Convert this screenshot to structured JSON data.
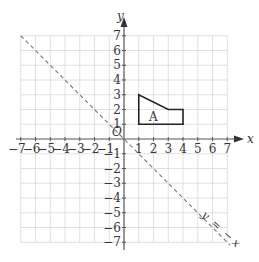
{
  "axes": {
    "x_label": "x",
    "y_label": "y",
    "origin_label": "O",
    "x_ticks": [
      "−7",
      "−6",
      "−5",
      "−4",
      "−3",
      "−2",
      "−1",
      "1",
      "2",
      "3",
      "4",
      "5",
      "6",
      "7"
    ],
    "y_ticks": [
      "7",
      "6",
      "5",
      "4",
      "3",
      "2",
      "1",
      "−1",
      "−2",
      "−3",
      "−4",
      "−5",
      "−6",
      "−7"
    ],
    "range": [
      -7,
      7
    ]
  },
  "shape": {
    "label": "A",
    "vertices": [
      [
        1,
        1
      ],
      [
        1,
        3
      ],
      [
        3,
        2
      ],
      [
        4,
        2
      ],
      [
        4,
        1
      ]
    ]
  },
  "line": {
    "label": "y = −x",
    "label_parts": [
      "y",
      "=",
      "−",
      "x"
    ],
    "style": "dashed"
  },
  "colors": {
    "grid": "#d8d8d8",
    "axis": "#555555",
    "shape": "#222222",
    "line": "#777777"
  }
}
